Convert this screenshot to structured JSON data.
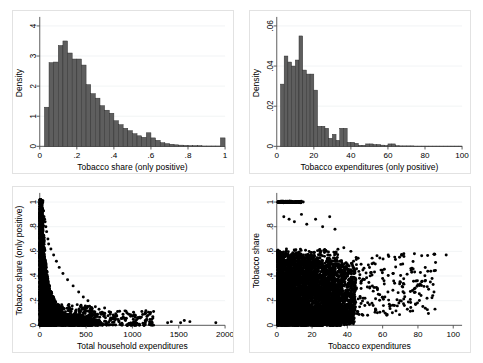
{
  "figure": {
    "panel_count": 4,
    "background_color": "#ffffff",
    "bar_color": "#5e5e5e",
    "point_color": "#000000",
    "grid_color": "#eceff1"
  },
  "chart_data": [
    {
      "id": "hist-tobacco-share",
      "position": "top-left",
      "type": "bar",
      "title": "",
      "xlabel": "Tobacco share (only positive)",
      "ylabel": "Density",
      "xlim": [
        0,
        1
      ],
      "ylim": [
        0,
        4.2
      ],
      "xticks": [
        0,
        0.2,
        0.4,
        0.6,
        0.8,
        1
      ],
      "xticklabels": [
        "0",
        ".2",
        ".4",
        ".6",
        ".8",
        "1"
      ],
      "yticks": [
        0,
        1,
        2,
        3,
        4
      ],
      "yticklabels": [
        "0",
        "1",
        "2",
        "3",
        "4"
      ],
      "grid": "horizontal",
      "bin_width": 0.025,
      "bin_starts": [
        0.025,
        0.05,
        0.075,
        0.1,
        0.125,
        0.15,
        0.175,
        0.2,
        0.225,
        0.25,
        0.275,
        0.3,
        0.325,
        0.35,
        0.375,
        0.4,
        0.425,
        0.45,
        0.475,
        0.5,
        0.525,
        0.55,
        0.575,
        0.6,
        0.625,
        0.65,
        0.675,
        0.7,
        0.725,
        0.75,
        0.775,
        0.8,
        0.825,
        0.85,
        0.875,
        0.9,
        0.925,
        0.95,
        0.975
      ],
      "values": [
        1.3,
        2.78,
        2.8,
        3.35,
        3.5,
        3.1,
        2.9,
        2.9,
        2.7,
        2.05,
        1.75,
        1.6,
        1.35,
        1.2,
        1.1,
        0.85,
        0.72,
        0.6,
        0.52,
        0.42,
        0.35,
        0.3,
        0.45,
        0.28,
        0.2,
        0.12,
        0.09,
        0.07,
        0.05,
        0.04,
        0.03,
        0.02,
        0.02,
        0.02,
        0.01,
        0.01,
        0.01,
        0.01,
        0.28
      ]
    },
    {
      "id": "hist-tobacco-expenditures",
      "position": "top-right",
      "type": "bar",
      "title": "",
      "xlabel": "Tobacco expenditures (only positive)",
      "ylabel": "Density",
      "xlim": [
        0,
        100
      ],
      "ylim": [
        0,
        0.063
      ],
      "xticks": [
        0,
        20,
        40,
        60,
        80,
        100
      ],
      "xticklabels": [
        "0",
        "20",
        "40",
        "60",
        "80",
        "100"
      ],
      "yticks": [
        0,
        0.02,
        0.04,
        0.06
      ],
      "yticklabels": [
        "0",
        ".02",
        ".04",
        ".06"
      ],
      "grid": "horizontal",
      "bin_width": 2,
      "bin_starts": [
        2,
        4,
        6,
        8,
        10,
        12,
        14,
        16,
        18,
        20,
        22,
        24,
        26,
        28,
        30,
        32,
        34,
        36,
        38,
        40,
        42,
        44,
        46,
        48,
        50,
        52,
        54,
        56,
        58,
        60,
        62,
        64,
        66,
        68,
        70,
        72,
        74,
        76,
        78,
        80,
        82,
        84,
        86,
        88,
        90,
        92,
        94,
        96,
        98
      ],
      "values": [
        0.031,
        0.045,
        0.042,
        0.04,
        0.043,
        0.055,
        0.038,
        0.036,
        0.036,
        0.028,
        0.01,
        0.01,
        0.009,
        0.004,
        0.006,
        0.003,
        0.009,
        0.009,
        0.002,
        0.002,
        0.0015,
        0.0005,
        0.0005,
        0.0012,
        0.0012,
        0.0009,
        0.0009,
        0.0006,
        0.0004,
        0.0012,
        0.0012,
        0.0003,
        0.0002,
        0.0002,
        0.0002,
        0.0002,
        0.0001,
        0.0001,
        0.0001,
        0.0001,
        0.0001,
        0.0001,
        0.0001,
        0.0001,
        0.0001,
        0.0001,
        0.0001,
        0.0001,
        0.0001
      ]
    },
    {
      "id": "scatter-share-vs-total-expenditure",
      "position": "bottom-left",
      "type": "scatter",
      "title": "",
      "xlabel": "Total household expenditures",
      "ylabel": "Tobacco share (only positive)",
      "xlim": [
        0,
        2000
      ],
      "ylim": [
        0,
        1.05
      ],
      "xticks": [
        0,
        500,
        1000,
        1500,
        2000
      ],
      "xticklabels": [
        "0",
        "500",
        "1000",
        "1500",
        "2000"
      ],
      "yticks": [
        0,
        0.2,
        0.4,
        0.6,
        0.8,
        1
      ],
      "yticklabels": [
        "0",
        ".2",
        ".4",
        ".6",
        ".8",
        "1"
      ],
      "grid": "horizontal",
      "marker_size": 3.0,
      "n_points_approx": 2800,
      "description": "Dense hyperbolic cloud hugging low x values, decaying toward zero share as total expenditure grows; sparse isolated points out to 2000.",
      "outlier_points": [
        [
          22,
          1.0
        ],
        [
          32,
          1.0
        ],
        [
          40,
          0.93
        ],
        [
          46,
          0.88
        ],
        [
          52,
          0.86
        ],
        [
          58,
          0.84
        ],
        [
          66,
          0.8
        ],
        [
          74,
          0.76
        ],
        [
          88,
          0.7
        ],
        [
          96,
          0.66
        ],
        [
          120,
          0.62
        ],
        [
          150,
          0.57
        ],
        [
          180,
          0.52
        ],
        [
          210,
          0.47
        ],
        [
          250,
          0.42
        ],
        [
          300,
          0.37
        ],
        [
          360,
          0.32
        ],
        [
          420,
          0.27
        ],
        [
          470,
          0.23
        ],
        [
          520,
          0.2
        ],
        [
          600,
          0.15
        ],
        [
          640,
          0.13
        ],
        [
          700,
          0.14
        ],
        [
          760,
          0.09
        ],
        [
          830,
          0.08
        ],
        [
          900,
          0.07
        ],
        [
          960,
          0.09
        ],
        [
          1010,
          0.05
        ],
        [
          1140,
          0.02
        ],
        [
          1380,
          0.02
        ],
        [
          1420,
          0.03
        ],
        [
          1520,
          0.02
        ],
        [
          1560,
          0.04
        ],
        [
          1620,
          0.03
        ],
        [
          1900,
          0.02
        ]
      ]
    },
    {
      "id": "scatter-share-vs-tobacco-expenditure",
      "position": "bottom-right",
      "type": "scatter",
      "title": "",
      "xlabel": "Tobacco expenditures",
      "ylabel": "Tobacco share",
      "xlim": [
        0,
        105
      ],
      "ylim": [
        0,
        1.05
      ],
      "xticks": [
        0,
        20,
        40,
        60,
        80,
        100
      ],
      "xticklabels": [
        "0",
        "20",
        "40",
        "60",
        "80",
        "100"
      ],
      "yticks": [
        0,
        0.2,
        0.4,
        0.6,
        0.8,
        1
      ],
      "yticklabels": [
        "0",
        ".2",
        ".4",
        ".6",
        ".8",
        "1"
      ],
      "grid": "horizontal",
      "marker_size": 3.0,
      "n_points_approx": 3000,
      "description": "Dense black mass for expenditures under ~45 spanning shares 0 to 0.6, a saturated horizontal band of points at share = 1 for low expenditures, and a scattered right tail out to 100.",
      "outlier_points": [
        [
          4,
          0.88
        ],
        [
          7,
          0.86
        ],
        [
          10,
          0.84
        ],
        [
          14,
          0.9
        ],
        [
          17,
          0.82
        ],
        [
          22,
          0.86
        ],
        [
          26,
          0.8
        ],
        [
          30,
          0.88
        ],
        [
          33,
          0.78
        ],
        [
          38,
          0.63
        ],
        [
          42,
          0.6
        ],
        [
          45,
          0.55
        ],
        [
          48,
          0.36
        ],
        [
          50,
          0.22
        ],
        [
          54,
          0.5
        ],
        [
          57,
          0.3
        ],
        [
          60,
          0.38
        ],
        [
          63,
          0.27
        ],
        [
          66,
          0.42
        ],
        [
          70,
          0.35
        ],
        [
          72,
          0.58
        ],
        [
          74,
          0.13
        ],
        [
          76,
          0.46
        ],
        [
          78,
          0.58
        ],
        [
          80,
          0.33
        ],
        [
          84,
          0.36
        ],
        [
          88,
          0.38
        ],
        [
          96,
          0.57
        ]
      ]
    }
  ]
}
